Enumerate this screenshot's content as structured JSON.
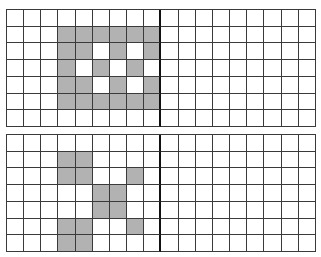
{
  "colors": {
    "filled": "#b2b2b2",
    "empty": "#ffffff",
    "grid_line": "#3a3a3a",
    "divider_line": "#111111"
  },
  "grids": [
    {
      "id": "top",
      "rows": 7,
      "cols": 18,
      "divider_after_col": 8,
      "cells": [
        "000000000000000000",
        "000111111000000000",
        "000110101000000000",
        "000101010000000000",
        "000110101000000000",
        "000111111000000000",
        "000000000000000000"
      ]
    },
    {
      "id": "bottom",
      "rows": 7,
      "cols": 18,
      "divider_after_col": 8,
      "cells": [
        "000000000000000000",
        "000110000000000000",
        "000110010000000000",
        "000001100000000000",
        "000001100000000000",
        "000110010000000000",
        "000110000000000000"
      ]
    }
  ]
}
